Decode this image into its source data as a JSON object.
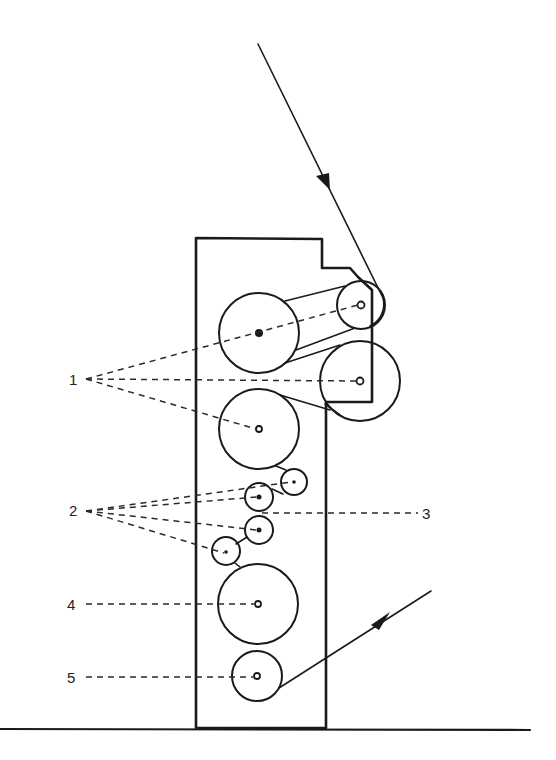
{
  "diagram": {
    "title": "",
    "colors": {
      "ink": "#1a1a1a",
      "background": "#ffffff"
    },
    "labels": [
      {
        "id": "1",
        "text": "1",
        "points_to": [
          "roller-upper-left",
          "roller-top-right-small",
          "roller-right-large",
          "roller-middle-left"
        ]
      },
      {
        "id": "2",
        "text": "2",
        "points_to": [
          "small-roller-upper",
          "small-roller-a",
          "small-roller-b",
          "small-roller-lower-left"
        ]
      },
      {
        "id": "3",
        "text": "3",
        "points_to": [
          "nip-between-small-rollers"
        ]
      },
      {
        "id": "4",
        "text": "4",
        "points_to": [
          "roller-lower-large"
        ]
      },
      {
        "id": "5",
        "text": "5",
        "points_to": [
          "roller-bottom"
        ]
      }
    ],
    "flow": {
      "incoming": "web enters from top, arrow pointing down toward upper right roller",
      "outgoing": "web exits at bottom right, arrow pointing up-right"
    },
    "components": {
      "frame": "vertical machine frame with stepped top-right corner",
      "ground": "horizontal base line"
    }
  }
}
